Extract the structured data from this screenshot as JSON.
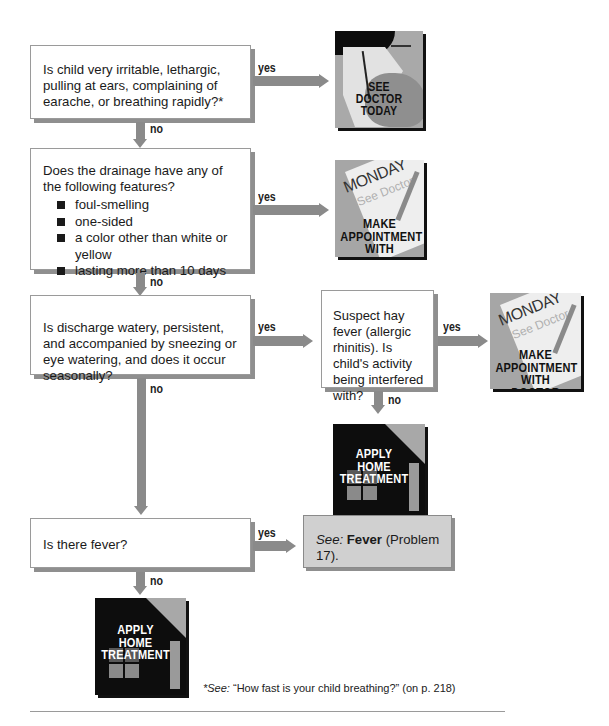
{
  "flowchart": {
    "q1": {
      "text": "Is child very irritable, lethargic, pulling at ears, complaining of earache, or breathing rapidly?*"
    },
    "q2": {
      "text": "Does the drainage have any of the following features?",
      "bullets": [
        "foul-smelling",
        "one-sided",
        "a color other than white or yellow",
        "lasting more than 10 days"
      ]
    },
    "q3": {
      "text": "Is discharge watery, persistent, and accompanied by sneezing or eye watering, and does it occur seasonally?"
    },
    "q4": {
      "text": "Suspect hay fever (allergic rhinitis). Is child's activity being interfered with?"
    },
    "q5": {
      "text": "Is there fever?"
    },
    "labels": {
      "yes": "yes",
      "no": "no"
    },
    "outcomes": {
      "see_doctor_today": {
        "line1": "SEE",
        "line2": "DOCTOR",
        "line3": "TODAY"
      },
      "make_appointment": {
        "monday": "MONDAY",
        "see_doctor": "See Doctor",
        "line1": "MAKE",
        "line2": "APPOINTMENT",
        "line3": "WITH DOCTOR"
      },
      "home_treatment": {
        "line1": "APPLY",
        "line2": "HOME",
        "line3": "TREATMENT"
      },
      "fever_ref": {
        "see": "See:",
        "topic": "Fever",
        "rest": " (Problem 17)."
      }
    },
    "footnote": {
      "see": "*See:",
      "text": " “How fast is your child breathing?” (on p. 218)"
    }
  }
}
